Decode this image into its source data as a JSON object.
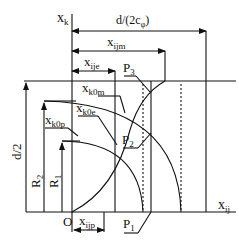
{
  "diagram": {
    "axes": {
      "vertical_label": "x",
      "vertical_sub": "k",
      "horizontal_label": "x",
      "horizontal_sub": "ij",
      "origin_label": "O"
    },
    "dimensions": {
      "top_span_label": "d/(2c",
      "top_span_sub": "φ",
      "top_span_close": ")",
      "xijm_label": "x",
      "xijm_sub": "ijm",
      "xije_label": "x",
      "xije_sub": "ije",
      "xijp_label": "x",
      "xijp_sub": "ijp",
      "half_d_label": "d/2",
      "r2_label": "R",
      "r2_sub": "2",
      "r1_label": "R",
      "r1_sub": "1"
    },
    "curve_labels": {
      "xk0m_label": "x",
      "xk0m_sub": "k0m",
      "xk0e_label": "x",
      "xk0e_sub": "k0e",
      "xk0p_label": "x",
      "xk0p_sub": "k0p"
    },
    "points": {
      "p1_label": "P",
      "p1_sub": "1",
      "p2_label": "P",
      "p2_sub": "2",
      "p3_label": "P",
      "p3_sub": "3"
    },
    "colors": {
      "line": "#111111",
      "background": "#ffffff"
    }
  }
}
